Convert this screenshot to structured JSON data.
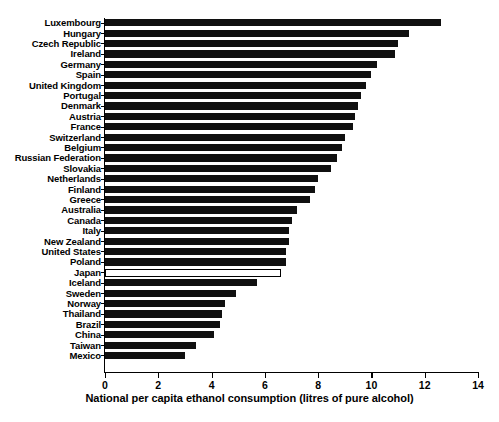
{
  "chart_data": {
    "type": "bar",
    "orientation": "horizontal",
    "title": "",
    "xlabel": "National per capita ethanol consumption (litres of pure alcohol)",
    "ylabel": "",
    "xlim": [
      0,
      14
    ],
    "xticks": [
      0,
      2,
      4,
      6,
      8,
      10,
      12,
      14
    ],
    "grid": false,
    "legend": "none",
    "bar_color": "#101010",
    "highlight_color": "#ffffff",
    "highlight_edge_color": "#000000",
    "highlighted_category": "Japan",
    "categories": [
      "Luxembourg",
      "Hungary",
      "Czech Republic",
      "Ireland",
      "Germany",
      "Spain",
      "United Kingdom",
      "Portugal",
      "Denmark",
      "Austria",
      "France",
      "Switzerland",
      "Belgium",
      "Russian Federation",
      "Slovakia",
      "Netherlands",
      "Finland",
      "Greece",
      "Australia",
      "Canada",
      "Italy",
      "New Zealand",
      "United States",
      "Poland",
      "Japan",
      "Iceland",
      "Sweden",
      "Norway",
      "Thailand",
      "Brazil",
      "China",
      "Taiwan",
      "Mexico"
    ],
    "values": [
      12.6,
      11.4,
      11.0,
      10.9,
      10.2,
      10.0,
      9.8,
      9.6,
      9.5,
      9.4,
      9.3,
      9.0,
      8.9,
      8.7,
      8.5,
      8.0,
      7.9,
      7.7,
      7.2,
      7.0,
      6.9,
      6.9,
      6.8,
      6.8,
      6.6,
      5.7,
      4.9,
      4.5,
      4.4,
      4.3,
      4.1,
      3.4,
      3.0
    ]
  }
}
